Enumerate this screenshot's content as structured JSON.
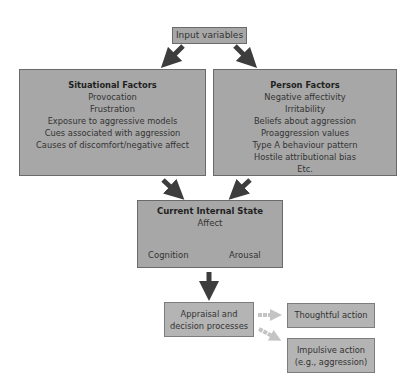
{
  "input": {
    "label": "Input variables"
  },
  "situational": {
    "title": "Situational Factors",
    "items": [
      "Provocation",
      "Frustration",
      "Exposure to aggressive models",
      "Cues associated with aggression",
      "Causes of discomfort/negative affect"
    ]
  },
  "person": {
    "title": "Person Factors",
    "items": [
      "Negative affectivity",
      "Irritability",
      "Beliefs about aggression",
      "Proaggression values",
      "Type A behaviour pattern",
      "Hostile attributional bias",
      "Etc."
    ]
  },
  "state": {
    "title": "Current Internal State",
    "affect": "Affect",
    "cognition": "Cognition",
    "arousal": "Arousal"
  },
  "appraisal": {
    "line1": "Appraisal and",
    "line2": "decision processes"
  },
  "outcomes": {
    "thoughtful": "Thoughtful action",
    "impulsive_line1": "Impulsive action",
    "impulsive_line2": "(e.g., aggression)"
  },
  "colors": {
    "box": "#a7a7a7",
    "arrow_dark": "#3d3d3d",
    "arrow_light": "#c4c4c4"
  }
}
